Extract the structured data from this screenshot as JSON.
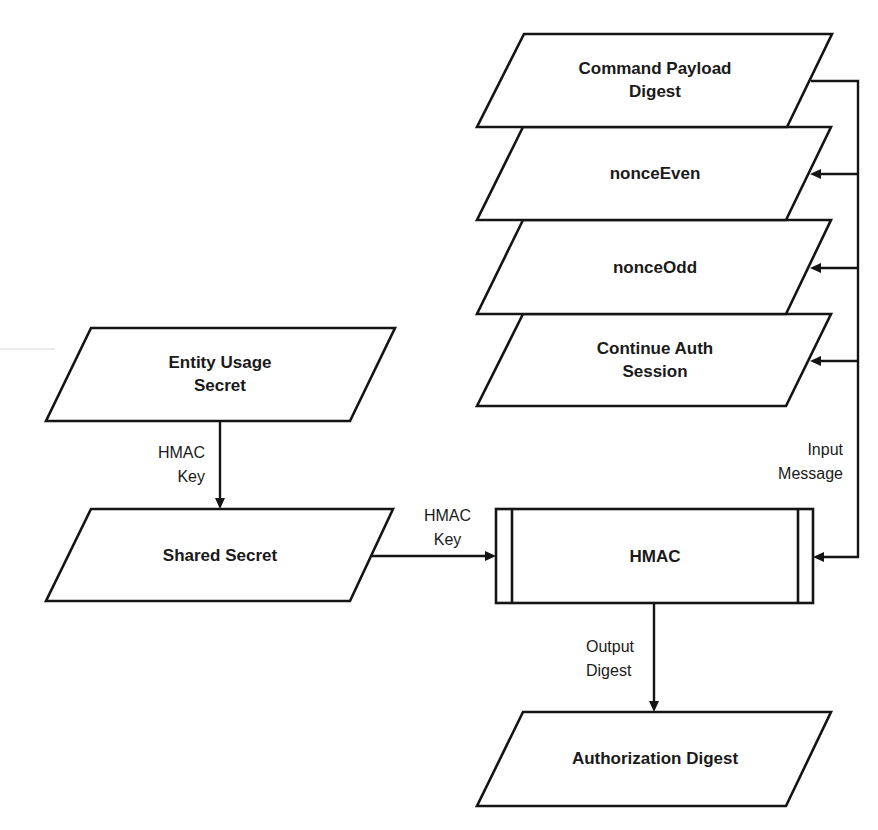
{
  "diagram": {
    "title": "",
    "nodes": {
      "command_payload_digest": {
        "label": "Command Payload\nDigest",
        "shape": "parallelogram"
      },
      "nonce_even": {
        "label": "nonceEven",
        "shape": "parallelogram"
      },
      "nonce_odd": {
        "label": "nonceOdd",
        "shape": "parallelogram"
      },
      "continue_auth_session": {
        "label": "Continue Auth\nSession",
        "shape": "parallelogram"
      },
      "entity_usage_secret": {
        "label": "Entity Usage\nSecret",
        "shape": "parallelogram"
      },
      "shared_secret": {
        "label": "Shared Secret",
        "shape": "parallelogram"
      },
      "hmac": {
        "label": "HMAC",
        "shape": "predefined-process"
      },
      "authorization_digest": {
        "label": "Authorization Digest",
        "shape": "parallelogram"
      }
    },
    "edges": {
      "entity_to_shared": {
        "from": "Entity Usage Secret",
        "to": "Shared Secret",
        "label": "HMAC\nKey"
      },
      "shared_to_hmac": {
        "from": "Shared Secret",
        "to": "HMAC",
        "label": "HMAC\nKey"
      },
      "inputs_to_hmac": {
        "from": "Command Payload Digest, nonceEven, nonceOdd, Continue Auth Session",
        "to": "HMAC",
        "label": "Input\nMessage"
      },
      "hmac_to_auth": {
        "from": "HMAC",
        "to": "Authorization Digest",
        "label": "Output\nDigest"
      }
    },
    "colors": {
      "stroke": "#141414",
      "fill": "#ffffff",
      "text": "#1a1a1a"
    }
  }
}
